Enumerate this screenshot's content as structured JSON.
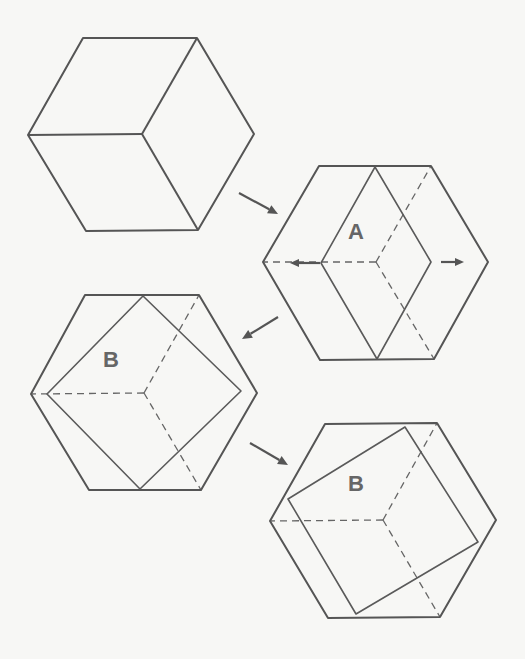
{
  "figure": {
    "stroke_color": "#555555",
    "background_color": "#f7f7f5",
    "panels": [
      {
        "id": "cube",
        "label": "",
        "hexagon": [
          [
            83,
            38
          ],
          [
            197,
            38
          ],
          [
            254,
            134
          ],
          [
            198,
            230
          ],
          [
            86,
            231
          ],
          [
            28,
            135
          ]
        ],
        "solid_lines": [
          [
            [
              197,
              38
            ],
            [
              142,
              134
            ]
          ],
          [
            [
              142,
              134
            ],
            [
              28,
              135
            ]
          ],
          [
            [
              142,
              134
            ],
            [
              198,
              230
            ]
          ]
        ],
        "dashed_lines": [],
        "inner_shape": []
      },
      {
        "id": "state-a",
        "label": "A",
        "label_pos": [
          356,
          232
        ],
        "hexagon": [
          [
            319,
            166
          ],
          [
            431,
            166
          ],
          [
            488,
            262
          ],
          [
            434,
            359
          ],
          [
            320,
            360
          ],
          [
            263,
            262
          ]
        ],
        "inner_shape": [
          [
            375,
            167
          ],
          [
            431,
            262
          ],
          [
            377,
            359
          ],
          [
            321,
            263
          ]
        ],
        "dashed_lines": [
          [
            [
              376,
              262
            ],
            [
              431,
              166
            ]
          ],
          [
            [
              376,
              262
            ],
            [
              263,
              262
            ]
          ],
          [
            [
              376,
              262
            ],
            [
              434,
              359
            ]
          ]
        ]
      },
      {
        "id": "state-b-1",
        "label": "B",
        "label_pos": [
          111,
          360
        ],
        "hexagon": [
          [
            85,
            295
          ],
          [
            199,
            295
          ],
          [
            257,
            393
          ],
          [
            201,
            490
          ],
          [
            89,
            490
          ],
          [
            31,
            394
          ]
        ],
        "inner_shape": [
          [
            143,
            296
          ],
          [
            241,
            391
          ],
          [
            140,
            489
          ],
          [
            47,
            394
          ]
        ],
        "dashed_lines": [
          [
            [
              144,
              393
            ],
            [
              199,
              295
            ]
          ],
          [
            [
              144,
              393
            ],
            [
              31,
              394
            ]
          ],
          [
            [
              144,
              393
            ],
            [
              201,
              490
            ]
          ]
        ]
      },
      {
        "id": "state-b-2",
        "label": "B",
        "label_pos": [
          356,
          484
        ],
        "hexagon": [
          [
            325,
            424
          ],
          [
            437,
            423
          ],
          [
            496,
            520
          ],
          [
            440,
            617
          ],
          [
            328,
            618
          ],
          [
            270,
            521
          ]
        ],
        "inner_shape": [
          [
            405,
            427
          ],
          [
            478,
            542
          ],
          [
            356,
            614
          ],
          [
            288,
            499
          ]
        ],
        "dashed_lines": [
          [
            [
              383,
              520
            ],
            [
              437,
              423
            ]
          ],
          [
            [
              383,
              520
            ],
            [
              270,
              521
            ]
          ],
          [
            [
              383,
              520
            ],
            [
              440,
              617
            ]
          ]
        ]
      }
    ],
    "transition_arrows": [
      {
        "from": [
          239,
          193
        ],
        "to": [
          278,
          214
        ]
      },
      {
        "from": [
          278,
          317
        ],
        "to": [
          242,
          339
        ]
      },
      {
        "from": [
          250,
          443
        ],
        "to": [
          288,
          465
        ]
      }
    ],
    "motion_arrows": [
      {
        "from": [
          320,
          263
        ],
        "to": [
          290,
          263
        ]
      },
      {
        "from": [
          441,
          262
        ],
        "to": [
          464,
          262
        ]
      }
    ]
  }
}
